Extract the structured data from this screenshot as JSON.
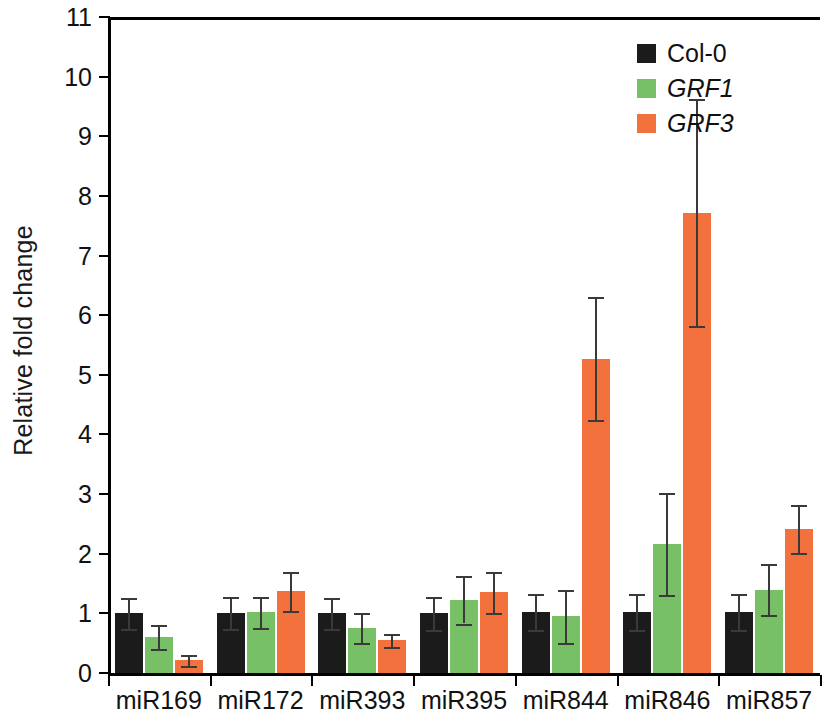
{
  "figure": {
    "y_axis_title": "Relative fold change"
  },
  "legend": {
    "items": [
      {
        "label": "Col-0",
        "color": "#1b1b1b",
        "italic": false,
        "key": "col0"
      },
      {
        "label": "GRF1",
        "color": "#77c065",
        "italic": true,
        "key": "grf1"
      },
      {
        "label": "GRF3",
        "color": "#f2713c",
        "italic": true,
        "key": "grf3"
      }
    ]
  },
  "axis": {
    "y_ticks": [
      "0",
      "1",
      "2",
      "3",
      "4",
      "5",
      "6",
      "7",
      "8",
      "9",
      "10",
      "11"
    ],
    "y_min": 0,
    "y_max": 11
  },
  "chart_data": {
    "type": "bar",
    "title": "",
    "xlabel": "",
    "ylabel": "Relative fold change",
    "ylim": [
      0,
      11
    ],
    "grid": false,
    "legend_position": "top-right",
    "categories": [
      "miR169",
      "miR172",
      "miR393",
      "miR395",
      "miR844",
      "miR846",
      "miR857"
    ],
    "series": [
      {
        "name": "Col-0",
        "color": "#1b1b1b",
        "values": [
          1.0,
          1.0,
          1.0,
          1.0,
          1.02,
          1.02,
          1.02
        ],
        "errors": [
          0.26,
          0.27,
          0.26,
          0.28,
          0.3,
          0.3,
          0.3
        ]
      },
      {
        "name": "GRF1",
        "color": "#77c065",
        "values": [
          0.6,
          1.02,
          0.76,
          1.23,
          0.95,
          2.16,
          1.4
        ],
        "errors": [
          0.2,
          0.26,
          0.25,
          0.4,
          0.45,
          0.85,
          0.42
        ]
      },
      {
        "name": "GRF3",
        "color": "#f2713c",
        "values": [
          0.21,
          1.37,
          0.55,
          1.35,
          5.27,
          7.72,
          2.42
        ],
        "errors": [
          0.09,
          0.33,
          0.11,
          0.34,
          1.03,
          1.9,
          0.4
        ]
      }
    ]
  }
}
